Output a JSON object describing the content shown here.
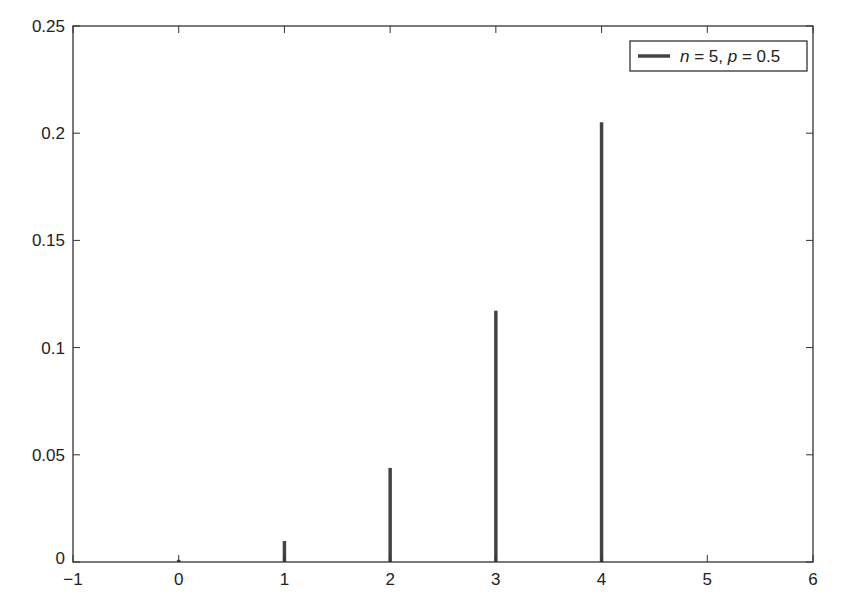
{
  "chart_data": {
    "type": "bar",
    "subtype": "stem",
    "title": "",
    "xlabel": "",
    "ylabel": "",
    "xlim": [
      -1,
      6
    ],
    "ylim": [
      0,
      0.25
    ],
    "grid": false,
    "legend_position": "upper right",
    "x_ticks": [
      -1,
      0,
      1,
      2,
      3,
      4,
      5,
      6
    ],
    "x_tick_labels": [
      "−1",
      "0",
      "1",
      "2",
      "3",
      "4",
      "5",
      "6"
    ],
    "y_ticks": [
      0,
      0.05,
      0.1,
      0.15,
      0.2,
      0.25
    ],
    "y_tick_labels": [
      "0",
      "0.05",
      "0.1",
      "0.15",
      "0.2",
      "0.25"
    ],
    "series": [
      {
        "name": "n = 5, p = 0.5",
        "color": "#444444",
        "x": [
          0,
          1,
          2,
          3,
          4,
          5
        ],
        "values": [
          0.001,
          0.0098,
          0.0439,
          0.1172,
          0.2051,
          0.0
        ]
      }
    ]
  },
  "legend": {
    "items": [
      {
        "label_parts": [
          "n",
          " = 5, ",
          "p",
          " = 0.5"
        ],
        "color": "#444444"
      }
    ]
  },
  "colors": {
    "axis": "#333333",
    "stem": "#444444",
    "background": "#ffffff"
  }
}
